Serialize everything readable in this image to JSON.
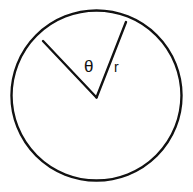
{
  "figure": {
    "name": "circle-sector-diagram",
    "background_color": "#ffffff",
    "stroke_color": "#111111",
    "canvas": {
      "width": 193,
      "height": 192
    }
  },
  "circle": {
    "name": "circle-outline",
    "center_x": 96.5,
    "center_y": 95.5,
    "radius": 85,
    "stroke_width": 2.4
  },
  "radii": [
    {
      "name": "radius-left",
      "x1": 96.5,
      "y1": 97.5,
      "x2": 43,
      "y2": 41,
      "stroke_width": 2.4
    },
    {
      "name": "radius-right",
      "x1": 96.5,
      "y1": 97.5,
      "x2": 126,
      "y2": 22,
      "stroke_width": 2.4
    }
  ],
  "labels": {
    "theta": {
      "text": "θ",
      "x": 84,
      "y": 72,
      "meaning": "central-angle"
    },
    "radius": {
      "text": "r",
      "x": 114,
      "y": 72,
      "meaning": "radius-length"
    }
  }
}
